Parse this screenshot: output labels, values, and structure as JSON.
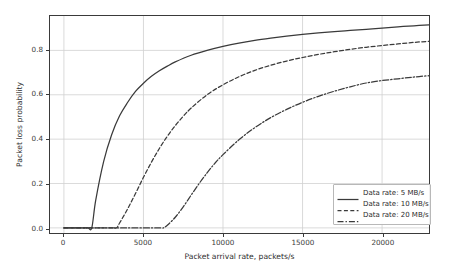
{
  "chart_data": {
    "type": "line",
    "title": "",
    "xlabel": "Packet arrival rate, packets/s",
    "ylabel": "Packet loss probability",
    "xlim": [
      -875,
      22950
    ],
    "ylim": [
      -0.023,
      0.955
    ],
    "xticks": [
      0,
      5000,
      10000,
      15000,
      20000
    ],
    "xticklabels": [
      "0",
      "5000",
      "10000",
      "15000",
      "20000"
    ],
    "yticks": [
      0.0,
      0.2,
      0.4,
      0.6,
      0.8
    ],
    "yticklabels": [
      "0.0",
      "0.2",
      "0.4",
      "0.6",
      "0.8"
    ],
    "grid": true,
    "legend_position": "lower right",
    "series": [
      {
        "name": "Data rate: 5 MB/s",
        "linestyle": "solid",
        "color": "#3a3a3a",
        "x": [
          0,
          500,
          1000,
          1500,
          1750,
          2000,
          2500,
          3000,
          3500,
          4000,
          4500,
          5000,
          5500,
          6000,
          6500,
          7000,
          8000,
          9000,
          10000,
          11000,
          12000,
          13000,
          14000,
          15000,
          16000,
          17000,
          18000,
          19000,
          20000,
          21000,
          22000,
          22950
        ],
        "y": [
          0.0,
          0.0,
          0.0,
          0.0,
          0.0,
          0.125,
          0.3,
          0.42,
          0.505,
          0.565,
          0.615,
          0.652,
          0.683,
          0.708,
          0.729,
          0.748,
          0.778,
          0.8,
          0.818,
          0.833,
          0.845,
          0.855,
          0.864,
          0.872,
          0.879,
          0.885,
          0.89,
          0.895,
          0.9,
          0.906,
          0.911,
          0.915
        ]
      },
      {
        "name": "Data rate: 10 MB/s",
        "linestyle": "dashed",
        "color": "#3a3a3a",
        "x": [
          0,
          1000,
          2000,
          3000,
          3300,
          3500,
          4000,
          4500,
          5000,
          5500,
          6000,
          6500,
          7000,
          7500,
          8000,
          9000,
          10000,
          11000,
          12000,
          13000,
          14000,
          15000,
          16000,
          17000,
          18000,
          19000,
          20000,
          21000,
          22000,
          22950
        ],
        "y": [
          0.0,
          0.0,
          0.0,
          0.0,
          0.0,
          0.022,
          0.085,
          0.155,
          0.228,
          0.296,
          0.358,
          0.413,
          0.461,
          0.503,
          0.54,
          0.6,
          0.645,
          0.681,
          0.71,
          0.733,
          0.752,
          0.768,
          0.782,
          0.794,
          0.805,
          0.814,
          0.822,
          0.829,
          0.836,
          0.841
        ]
      },
      {
        "name": "Data rate: 20 MB/s",
        "linestyle": "dashdot",
        "color": "#3a3a3a",
        "x": [
          0,
          2000,
          4000,
          6000,
          6250,
          6500,
          7000,
          7500,
          8000,
          8500,
          9000,
          9500,
          10000,
          11000,
          12000,
          13000,
          14000,
          15000,
          16000,
          17000,
          18000,
          19000,
          20000,
          21000,
          22000,
          22950
        ],
        "y": [
          0.0,
          0.0,
          0.0,
          0.0,
          0.0,
          0.012,
          0.048,
          0.095,
          0.148,
          0.2,
          0.248,
          0.292,
          0.33,
          0.397,
          0.452,
          0.497,
          0.534,
          0.566,
          0.593,
          0.616,
          0.636,
          0.653,
          0.664,
          0.672,
          0.68,
          0.686
        ]
      }
    ]
  },
  "legend": {
    "items": [
      {
        "label": "Data rate: 5 MB/s",
        "style": "solid"
      },
      {
        "label": "Data rate: 10 MB/s",
        "style": "dashed"
      },
      {
        "label": "Data rate: 20 MB/s",
        "style": "dashdot"
      }
    ]
  },
  "colors": {
    "line": "#3a3a3a",
    "grid": "#d0d0d0",
    "frame": "#3a3a3a",
    "background": "#ffffff"
  }
}
